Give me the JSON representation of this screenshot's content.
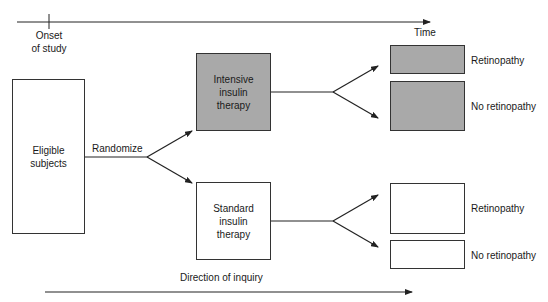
{
  "timeline": {
    "onset_label_line1": "Onset",
    "onset_label_line2": "of study",
    "time_label": "Time"
  },
  "start": {
    "label": "Eligible subjects",
    "randomize_label": "Randomize"
  },
  "arms": [
    {
      "label": "Intensive insulin therapy",
      "fill": "#a9a9a9",
      "outcomes": [
        {
          "label": "Retinopathy"
        },
        {
          "label": "No retinopathy"
        }
      ]
    },
    {
      "label": "Standard insulin therapy",
      "fill": "#ffffff",
      "outcomes": [
        {
          "label": "Retinopathy"
        },
        {
          "label": "No retinopathy"
        }
      ]
    }
  ],
  "footer": {
    "direction_label": "Direction of inquiry"
  },
  "colors": {
    "stroke": "#222222",
    "shaded": "#a9a9a9",
    "background": "#ffffff"
  }
}
